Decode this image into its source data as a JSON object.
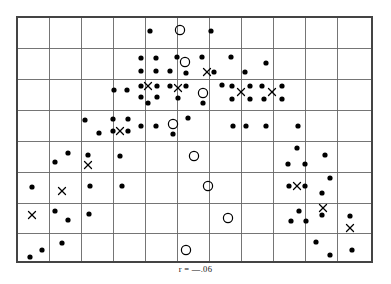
{
  "figure": {
    "caption": "r = —.06",
    "title": ""
  },
  "chart_data": {
    "type": "scatter",
    "title": "",
    "subtitle": "",
    "xlabel": "",
    "ylabel": "",
    "annotations": [
      "r = —.06"
    ],
    "grid": true,
    "legend": "none",
    "plot_frame": {
      "x0": 17,
      "y0": 17,
      "x1": 372,
      "y1": 262
    },
    "grid_columns": 11,
    "grid_rows": 8,
    "xlim": [
      0,
      11
    ],
    "ylim": [
      0,
      8
    ],
    "x_ticks": [
      0,
      1,
      2,
      3,
      4,
      5,
      6,
      7,
      8,
      9,
      10,
      11
    ],
    "y_ticks": [
      0,
      1,
      2,
      3,
      4,
      5,
      6,
      7,
      8
    ],
    "x_gridlines_px": [
      17,
      49,
      81,
      113,
      145,
      177,
      209,
      241,
      273,
      305,
      337,
      372
    ],
    "y_gridlines_px": [
      17,
      48,
      79,
      110,
      141,
      172,
      203,
      233,
      262
    ],
    "marker_styles": {
      "dot": {
        "shape": "filled-circle",
        "color": "#000000",
        "radius": 2.6
      },
      "open": {
        "shape": "open-circle",
        "color": "#000000",
        "radius": 4.6,
        "stroke": 1.2
      },
      "cross": {
        "shape": "x-mark",
        "color": "#000000",
        "size": 7,
        "stroke": 1.3
      }
    },
    "series": [
      {
        "name": "dot",
        "marker": "dot",
        "points": [
          [
            150,
            31
          ],
          [
            211,
            31
          ],
          [
            141,
            58
          ],
          [
            156,
            58
          ],
          [
            141,
            71
          ],
          [
            156,
            71
          ],
          [
            177,
            57
          ],
          [
            170,
            71
          ],
          [
            186,
            73
          ],
          [
            202,
            57
          ],
          [
            214,
            72
          ],
          [
            231,
            57
          ],
          [
            245,
            72
          ],
          [
            266,
            63
          ],
          [
            114,
            90
          ],
          [
            127,
            90
          ],
          [
            141,
            86
          ],
          [
            157,
            86
          ],
          [
            141,
            97
          ],
          [
            157,
            97
          ],
          [
            148,
            103
          ],
          [
            170,
            86
          ],
          [
            186,
            86
          ],
          [
            178,
            98
          ],
          [
            203,
            103
          ],
          [
            222,
            85
          ],
          [
            232,
            86
          ],
          [
            250,
            86
          ],
          [
            232,
            99
          ],
          [
            250,
            99
          ],
          [
            262,
            86
          ],
          [
            282,
            86
          ],
          [
            264,
            99
          ],
          [
            282,
            99
          ],
          [
            85,
            120
          ],
          [
            99,
            133
          ],
          [
            113,
            119
          ],
          [
            128,
            119
          ],
          [
            113,
            131
          ],
          [
            128,
            131
          ],
          [
            141,
            126
          ],
          [
            156,
            126
          ],
          [
            173,
            134
          ],
          [
            188,
            118
          ],
          [
            233,
            126
          ],
          [
            246,
            126
          ],
          [
            266,
            126
          ],
          [
            298,
            126
          ],
          [
            68,
            153
          ],
          [
            55,
            162
          ],
          [
            88,
            155
          ],
          [
            120,
            156
          ],
          [
            297,
            148
          ],
          [
            288,
            164
          ],
          [
            305,
            164
          ],
          [
            325,
            155
          ],
          [
            32,
            187
          ],
          [
            90,
            186
          ],
          [
            122,
            186
          ],
          [
            289,
            186
          ],
          [
            305,
            186
          ],
          [
            330,
            178
          ],
          [
            322,
            193
          ],
          [
            55,
            211
          ],
          [
            68,
            220
          ],
          [
            89,
            214
          ],
          [
            299,
            211
          ],
          [
            291,
            221
          ],
          [
            306,
            221
          ],
          [
            322,
            215
          ],
          [
            350,
            216
          ],
          [
            42,
            250
          ],
          [
            30,
            257
          ],
          [
            62,
            243
          ],
          [
            316,
            242
          ],
          [
            330,
            255
          ],
          [
            352,
            250
          ]
        ]
      },
      {
        "name": "open-circle",
        "marker": "open",
        "points": [
          [
            180,
            30
          ],
          [
            185,
            62
          ],
          [
            203,
            93
          ],
          [
            173,
            124
          ],
          [
            194,
            156
          ],
          [
            208,
            186
          ],
          [
            228,
            218
          ],
          [
            186,
            250
          ]
        ]
      },
      {
        "name": "x-mark",
        "marker": "cross",
        "points": [
          [
            207,
            72
          ],
          [
            148,
            86
          ],
          [
            178,
            88
          ],
          [
            241,
            92
          ],
          [
            272,
            92
          ],
          [
            120,
            131
          ],
          [
            88,
            165
          ],
          [
            62,
            191
          ],
          [
            297,
            186
          ],
          [
            323,
            208
          ],
          [
            32,
            215
          ],
          [
            350,
            228
          ]
        ]
      }
    ]
  }
}
